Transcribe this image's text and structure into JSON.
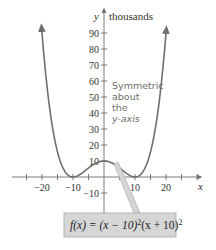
{
  "chart_data": {
    "type": "line",
    "title": "",
    "function": "f(x) = (x − 10)²(x + 10)²",
    "xlabel": "x",
    "ylabel": "y",
    "y_unit": "thousands",
    "x_ticks": [
      -20,
      -10,
      10,
      20
    ],
    "x_tick_labels": [
      "−20",
      "−10",
      "10",
      "20"
    ],
    "y_ticks": [
      -10,
      10,
      20,
      30,
      40,
      50,
      60,
      70,
      80,
      90
    ],
    "y_tick_labels": [
      "−10",
      "10",
      "20",
      "30",
      "40",
      "50",
      "60",
      "70",
      "80",
      "90"
    ],
    "xlim": [
      -28,
      28
    ],
    "ylim": [
      -15,
      100
    ],
    "grid": false,
    "points": [
      {
        "x": -20,
        "y": 90
      },
      {
        "x": -15,
        "y": 15.625
      },
      {
        "x": -10,
        "y": 0
      },
      {
        "x": -5,
        "y": 5.625
      },
      {
        "x": 0,
        "y": 10
      },
      {
        "x": 5,
        "y": 5.625
      },
      {
        "x": 10,
        "y": 0
      },
      {
        "x": 15,
        "y": 15.625
      },
      {
        "x": 20,
        "y": 90
      }
    ],
    "annotations": [
      {
        "text": "Symmetric about the y-axis"
      },
      {
        "text": "f(x) = (x − 10)²(x + 10)²",
        "type": "callout-box"
      }
    ],
    "legend": null,
    "colors": {
      "curve": "#6e6e6e",
      "axis": "#7a7a7a",
      "label_box_fill": "#d6d6d6",
      "label_box_border": "#a8a8a8",
      "annotation_text": "#707070"
    }
  },
  "labels": {
    "y_axis": "y",
    "y_unit": "thousands",
    "x_axis": "x",
    "annotation_lines": [
      "Symmetric",
      "about",
      "the",
      "y-axis"
    ],
    "formula": {
      "prefix": "f(x) = (x − 10)",
      "exp1": "2",
      "middle": "(x + 10)",
      "exp2": "2"
    }
  }
}
